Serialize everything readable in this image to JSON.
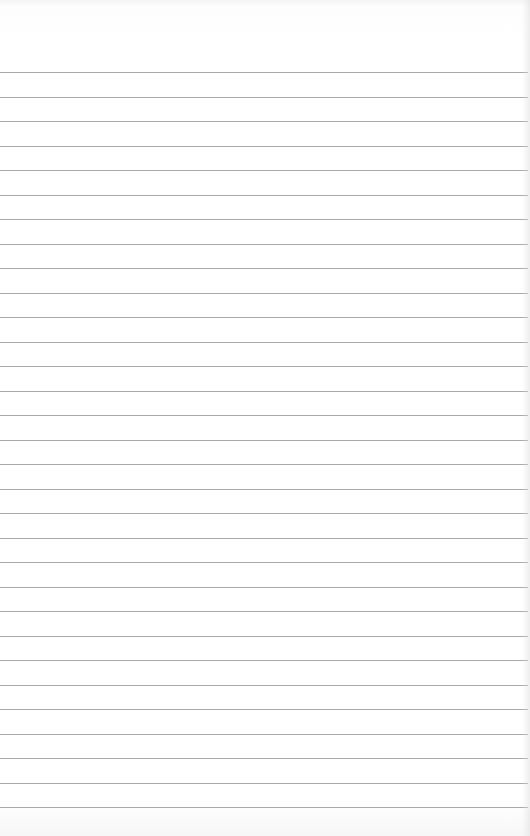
{
  "page": {
    "type": "lined-paper",
    "background_color": "#ffffff",
    "line_color": "#a9a9a9",
    "first_line_y": 72,
    "line_spacing": 24.5,
    "line_count": 31,
    "text_content": ""
  }
}
